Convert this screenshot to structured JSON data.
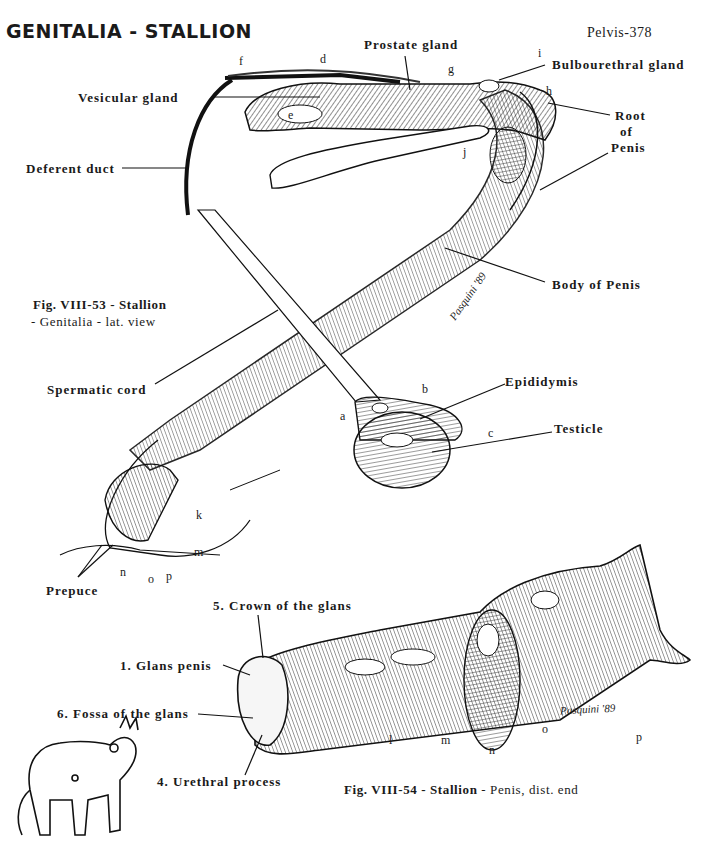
{
  "header": {
    "title": "GENITALIA - STALLION",
    "page_ref": "Pelvis-378"
  },
  "figure_53": {
    "caption_line1": "Fig. VIII-53 - Stallion",
    "caption_line2": "- Genitalia - lat. view",
    "labels": {
      "prostate_gland": "Prostate gland",
      "bulbourethral_gland": "Bulbourethral gland",
      "vesicular_gland": "Vesicular gland",
      "root_of_penis_1": "Root",
      "root_of_penis_2": "of",
      "root_of_penis_3": "Penis",
      "deferent_duct": "Deferent duct",
      "body_of_penis": "Body of Penis",
      "spermatic_cord": "Spermatic cord",
      "epididymis": "Epididymis",
      "testicle": "Testicle",
      "prepuce": "Prepuce"
    },
    "letters": [
      "a",
      "b",
      "c",
      "d",
      "e",
      "f",
      "g",
      "h",
      "i",
      "j",
      "k",
      "m",
      "n",
      "o",
      "p"
    ],
    "signature": "Pasquini '89"
  },
  "figure_54": {
    "caption_bold": "Fig. VIII-54 - Stallion",
    "caption_rest": " - Penis, dist. end",
    "labels": {
      "crown": "5. Crown of the glans",
      "glans": "1. Glans penis",
      "fossa": "6. Fossa of the glans",
      "urethral": "4. Urethral process"
    },
    "letters": [
      "l",
      "m",
      "n",
      "o",
      "p"
    ],
    "signature": "Pasquini '89"
  }
}
